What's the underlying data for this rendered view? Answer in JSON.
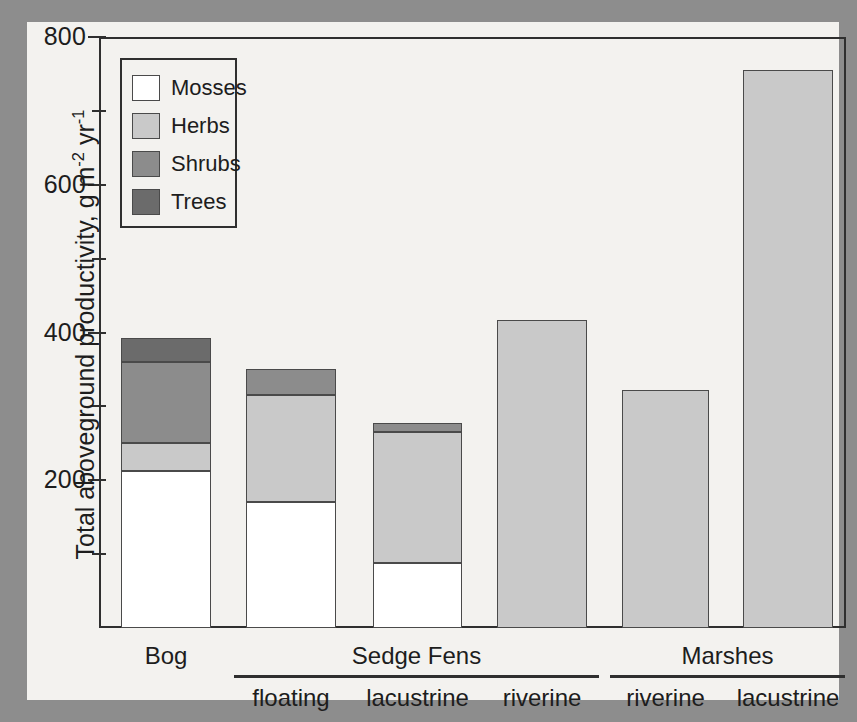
{
  "figure": {
    "background_color": "#f3f2ef",
    "scan_border_color": "#8d8d8d"
  },
  "legend": {
    "position": "top-left-inside",
    "entries": [
      {
        "label": "Mosses",
        "color": "#ffffff"
      },
      {
        "label": "Herbs",
        "color": "#c9c9c9"
      },
      {
        "label": "Shrubs",
        "color": "#8c8c8c"
      },
      {
        "label": "Trees",
        "color": "#6b6b6b"
      }
    ]
  },
  "yaxis": {
    "title_main": "Total aboveground productivity, g m",
    "title_sup1": "-2",
    "title_mid": " yr",
    "title_sup2": "-1",
    "ticks_major": [
      "800",
      "600",
      "400",
      "200"
    ],
    "tick_values_major": [
      800,
      600,
      400,
      200
    ],
    "tick_values_minor": [
      700,
      500,
      300,
      100
    ],
    "min": 0,
    "max": 800
  },
  "xaxis": {
    "groups": [
      {
        "label": "Bog",
        "rule": false
      },
      {
        "label": "Sedge Fens",
        "rule": true
      },
      {
        "label": "Marshes",
        "rule": true
      }
    ],
    "sublabels": [
      "floating",
      "lacustrine",
      "riverine",
      "riverine",
      "lacustrine"
    ]
  },
  "chart_data": {
    "type": "bar",
    "subtype": "stacked-bar",
    "title": "",
    "xlabel": "",
    "ylabel": "Total aboveground productivity, g m-2 yr-1",
    "ylim": [
      0,
      800
    ],
    "grid": false,
    "legend_position": "upper left (inset box)",
    "categories": [
      "Bog",
      "floating",
      "lacustrine",
      "riverine",
      "riverine",
      "lacustrine"
    ],
    "category_groups": [
      "Bog",
      "Sedge Fens",
      "Sedge Fens",
      "Sedge Fens",
      "Marshes",
      "Marshes"
    ],
    "series": [
      {
        "name": "Mosses",
        "color": "#ffffff",
        "values": [
          212,
          170,
          88,
          0,
          0,
          0
        ]
      },
      {
        "name": "Herbs",
        "color": "#c9c9c9",
        "values": [
          38,
          145,
          177,
          417,
          322,
          755
        ]
      },
      {
        "name": "Shrubs",
        "color": "#8c8c8c",
        "values": [
          110,
          35,
          13,
          0,
          0,
          0
        ]
      },
      {
        "name": "Trees",
        "color": "#6b6b6b",
        "values": [
          32,
          0,
          0,
          0,
          0,
          0
        ]
      }
    ],
    "totals": [
      392,
      350,
      278,
      417,
      322,
      755
    ]
  },
  "layout": {
    "bars": [
      {
        "name": "bog",
        "left": 121,
        "width": 90
      },
      {
        "name": "fen-floating",
        "left": 246,
        "width": 90
      },
      {
        "name": "fen-lacustrine",
        "left": 373,
        "width": 89
      },
      {
        "name": "fen-riverine",
        "left": 497,
        "width": 90
      },
      {
        "name": "marsh-riverine",
        "left": 622,
        "width": 87
      },
      {
        "name": "marsh-lacustrine",
        "left": 743,
        "width": 90
      }
    ],
    "plot": {
      "left": 99,
      "top": 37,
      "width": 747,
      "height": 591
    }
  }
}
